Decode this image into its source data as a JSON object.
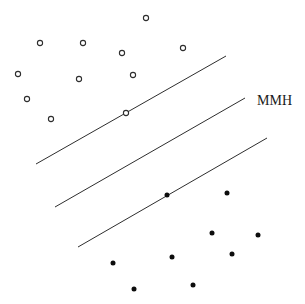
{
  "figure": {
    "background": "#ffffff",
    "line_color": "#2e2e2e",
    "open_marker_stroke": "#2e2e2e",
    "open_marker_fill": "#ffffff",
    "filled_marker_color": "#0d0d0d",
    "label_color": "#1a1a1a"
  },
  "chart_data": {
    "type": "scatter",
    "title": "",
    "xlabel": "",
    "ylabel": "",
    "axes_visible": false,
    "grid": false,
    "legend": "none",
    "pixel_space": [
      305,
      304
    ],
    "series": [
      {
        "name": "class-open-circles",
        "marker": "open-circle",
        "color": "#2e2e2e",
        "points": [
          [
            146,
            18
          ],
          [
            40,
            43
          ],
          [
            83,
            43
          ],
          [
            122,
            53
          ],
          [
            183,
            48
          ],
          [
            18,
            74
          ],
          [
            79,
            79
          ],
          [
            133,
            75
          ],
          [
            27,
            99
          ],
          [
            51,
            119
          ],
          [
            126,
            113
          ]
        ]
      },
      {
        "name": "class-filled-dots",
        "marker": "filled-circle",
        "color": "#0d0d0d",
        "points": [
          [
            167,
            195
          ],
          [
            227,
            193
          ],
          [
            212,
            233
          ],
          [
            258,
            235
          ],
          [
            232,
            254
          ],
          [
            172,
            257
          ],
          [
            113,
            263
          ],
          [
            134,
            289
          ],
          [
            193,
            285
          ]
        ]
      }
    ],
    "lines": [
      {
        "name": "upper-margin-line",
        "x1": 36,
        "y1": 164,
        "x2": 226,
        "y2": 56
      },
      {
        "name": "mmh-line",
        "x1": 55,
        "y1": 207,
        "x2": 245,
        "y2": 98
      },
      {
        "name": "lower-margin-line",
        "x1": 78,
        "y1": 247,
        "x2": 267,
        "y2": 138
      }
    ],
    "support_vectors": [
      {
        "series": "class-open-circles",
        "point": [
          126,
          113
        ],
        "on_line": "upper-margin-line"
      },
      {
        "series": "class-filled-dots",
        "point": [
          167,
          195
        ],
        "on_line": "lower-margin-line"
      }
    ],
    "annotations": [
      {
        "text": "MMH",
        "x": 257,
        "y": 105
      }
    ]
  }
}
